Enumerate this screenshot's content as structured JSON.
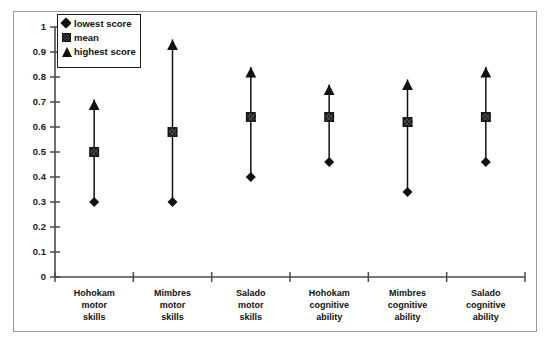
{
  "chart_data": {
    "type": "scatter",
    "title": "",
    "xlabel": "",
    "ylabel": "",
    "ylim": [
      0,
      1
    ],
    "grid": false,
    "legend_position": "top-left",
    "ytick_labels": [
      "1",
      "0.9",
      "0.8",
      "0.7",
      "0.6",
      "0.5",
      "0.4",
      "0.3",
      "0.2",
      "0.1",
      "0"
    ],
    "ytick_values": [
      1,
      0.9,
      0.8,
      0.7,
      0.6,
      0.5,
      0.4,
      0.3,
      0.2,
      0.1,
      0
    ],
    "categories": [
      "Hohokam motor skills",
      "Mimbres motor skills",
      "Salado motor skills",
      "Hohokam cognitive ability",
      "Mimbres cognitive ability",
      "Salado cognitive ability"
    ],
    "category_lines": [
      [
        "Hohokam",
        "motor",
        "skills"
      ],
      [
        "Mimbres",
        "motor",
        "skills"
      ],
      [
        "Salado",
        "motor",
        "skills"
      ],
      [
        "Hohokam",
        "cognitive",
        "ability"
      ],
      [
        "Mimbres",
        "cognitive",
        "ability"
      ],
      [
        "Salado",
        "cognitive",
        "ability"
      ]
    ],
    "series": [
      {
        "name": "lowest score",
        "marker": "diamond",
        "values": [
          0.3,
          0.3,
          0.4,
          0.46,
          0.34,
          0.46
        ]
      },
      {
        "name": "mean",
        "marker": "square",
        "values": [
          0.5,
          0.58,
          0.64,
          0.64,
          0.62,
          0.64
        ]
      },
      {
        "name": "highest score",
        "marker": "triangle",
        "values": [
          0.71,
          0.95,
          0.84,
          0.77,
          0.79,
          0.84
        ]
      }
    ],
    "marker_color": "#111111",
    "axis_color": "#4a4a4a",
    "frame_color": "#9a9a9a"
  },
  "legend": {
    "items": [
      {
        "label": "lowest score",
        "icon": "diamond-marker-icon"
      },
      {
        "label": "mean",
        "icon": "square-marker-icon"
      },
      {
        "label": "highest score",
        "icon": "triangle-marker-icon"
      }
    ]
  }
}
